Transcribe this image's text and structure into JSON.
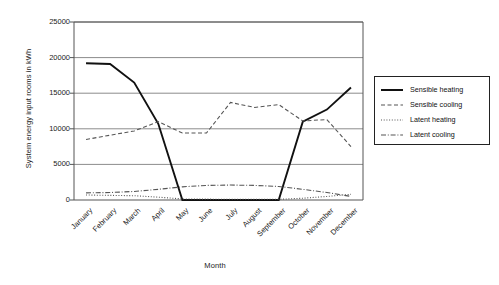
{
  "chart_data": {
    "type": "line",
    "title": "",
    "xlabel": "Month",
    "ylabel": "System energy input rooms in kWh",
    "categories": [
      "January",
      "February",
      "March",
      "April",
      "May",
      "June",
      "July",
      "August",
      "September",
      "October",
      "November",
      "December"
    ],
    "ylim": [
      0,
      25000
    ],
    "yticks": [
      0,
      5000,
      10000,
      15000,
      20000,
      25000
    ],
    "ytick_labels": [
      "0",
      "5000",
      "10000",
      "15000",
      "20000",
      "25000"
    ],
    "grid": true,
    "legend_position": "right-outside",
    "series": [
      {
        "name": "Sensible heating",
        "style": "solid",
        "color": "#111111",
        "values": [
          19200,
          19100,
          16500,
          10700,
          0,
          0,
          0,
          0,
          0,
          11000,
          12700,
          15800
        ]
      },
      {
        "name": "Sensible cooling",
        "style": "dashed",
        "color": "#555555",
        "values": [
          8500,
          9100,
          9700,
          11000,
          9400,
          9400,
          13700,
          13000,
          13400,
          11100,
          11300,
          7500
        ]
      },
      {
        "name": "Latent heating",
        "style": "dotted",
        "color": "#555555",
        "values": [
          700,
          650,
          600,
          400,
          150,
          120,
          100,
          100,
          100,
          250,
          500,
          800
        ]
      },
      {
        "name": "Latent cooling",
        "style": "dashdot",
        "color": "#555555",
        "values": [
          1000,
          1050,
          1200,
          1500,
          1850,
          2050,
          2100,
          2050,
          1900,
          1500,
          1050,
          500
        ]
      }
    ]
  },
  "legend": {
    "items": [
      {
        "label": "Sensible heating"
      },
      {
        "label": "Sensible cooling"
      },
      {
        "label": "Latent heating"
      },
      {
        "label": "Latent cooling"
      }
    ]
  }
}
